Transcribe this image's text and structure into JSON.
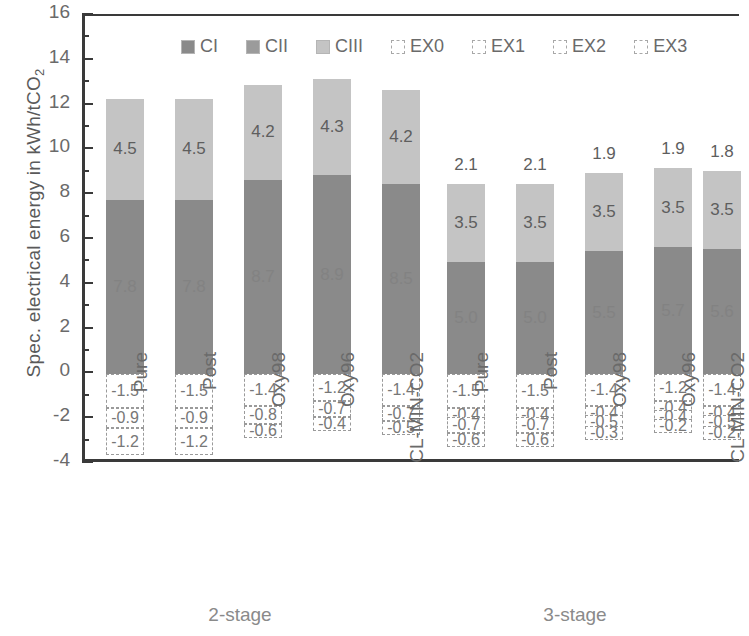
{
  "chart_data": {
    "type": "bar",
    "subtype": "stacked-bar",
    "title": "",
    "xlabel": "",
    "ylabel": "Spec. electrical energy in kWh/tCO2",
    "ylabel_display": "Spec. electrical energy in kWh/tCO",
    "ylabel_sub": "2",
    "ylim": [
      -4,
      16
    ],
    "ytick_step": 2,
    "yminor_step": 1,
    "grid": false,
    "legend_position": "top-inside",
    "yticks": [
      "16",
      "14",
      "12",
      "10",
      "8",
      "6",
      "4",
      "2",
      "0",
      "-2",
      "-4"
    ],
    "legend": [
      {
        "name": "CI",
        "color": "#8a8a8a",
        "style": "solid"
      },
      {
        "name": "CII",
        "color": "#9b9b9b",
        "style": "solid"
      },
      {
        "name": "CIII",
        "color": "#c4c4c4",
        "style": "solid"
      },
      {
        "name": "EX0",
        "color": "#ffffff",
        "style": "dashed"
      },
      {
        "name": "EX1",
        "color": "#ffffff",
        "style": "dashed"
      },
      {
        "name": "EX2",
        "color": "#ffffff",
        "style": "dashed"
      },
      {
        "name": "EX3",
        "color": "#ffffff",
        "style": "dashed"
      }
    ],
    "groups": [
      {
        "label": "2-stage",
        "categories": [
          "Pure",
          "Post",
          "Oxy98",
          "Oxy96",
          "CL-MIN-CO2"
        ]
      },
      {
        "label": "3-stage",
        "categories": [
          "Pure",
          "Post",
          "Oxy98",
          "Oxy96",
          "CL-MIN-CO2"
        ]
      }
    ],
    "categories": [
      "Pure",
      "Post",
      "Oxy98",
      "Oxy96",
      "CL-MIN-CO2",
      "Pure",
      "Post",
      "Oxy98",
      "Oxy96",
      "CL-MIN-CO2"
    ],
    "series": [
      {
        "name": "CI",
        "values": [
          7.8,
          7.8,
          4.7,
          4.9,
          4.3,
          5.0,
          5.0,
          5.0,
          5.0,
          5.2
        ]
      },
      {
        "name": "CII",
        "values": [
          0.0,
          0.0,
          4.0,
          4.0,
          4.2,
          0.0,
          0.0,
          0.0,
          0.0,
          0.0
        ]
      },
      {
        "name": "CIII",
        "values": [
          4.5,
          4.5,
          4.2,
          4.3,
          4.2,
          3.5,
          3.5,
          3.5,
          3.5,
          3.5
        ]
      },
      {
        "name": "EX0",
        "values": [
          2.1,
          2.1,
          1.9,
          1.9,
          1.8,
          2.1,
          2.1,
          1.9,
          1.9,
          1.8
        ]
      },
      {
        "name": "EX1",
        "values": [
          -1.5,
          -1.5,
          -1.4,
          -1.2,
          -1.4,
          -1.5,
          -1.5,
          -1.4,
          -1.2,
          -1.4
        ]
      },
      {
        "name": "EX2",
        "values": [
          -0.9,
          -0.9,
          -0.8,
          -0.7,
          -0.7,
          -0.4,
          -0.4,
          -0.4,
          -0.4,
          -0.4
        ]
      },
      {
        "name": "EX3",
        "values": [
          -1.2,
          -1.2,
          -0.6,
          -0.4,
          -0.5,
          -0.7,
          -0.7,
          -0.5,
          -0.4,
          -0.5
        ]
      },
      {
        "name": "EX4",
        "values": [
          null,
          null,
          null,
          null,
          null,
          -0.6,
          -0.6,
          -0.3,
          -0.2,
          -0.2
        ]
      }
    ],
    "bars": [
      {
        "category": "Pure",
        "group": "2-stage",
        "stack": [
          {
            "key": "ci",
            "value": 7.8,
            "label": "7.8",
            "from": 0.0,
            "to": 7.8,
            "show": "faint"
          },
          {
            "key": "ciii",
            "value": 4.5,
            "label": "4.5",
            "from": 7.8,
            "to": 12.3,
            "show": "inside"
          }
        ],
        "neg": [
          {
            "key": "ex1",
            "label": "-1.5",
            "from": 0.0,
            "to": -1.5
          },
          {
            "key": "ex2",
            "label": "-0.9",
            "from": -1.5,
            "to": -2.4
          },
          {
            "key": "ex3",
            "label": "-1.2",
            "from": -2.4,
            "to": -3.6
          }
        ]
      },
      {
        "category": "Post",
        "group": "2-stage",
        "stack": [
          {
            "key": "ci",
            "value": 7.8,
            "label": "7.8",
            "from": 0.0,
            "to": 7.8,
            "show": "faint"
          },
          {
            "key": "ciii",
            "value": 4.5,
            "label": "4.5",
            "from": 7.8,
            "to": 12.3,
            "show": "inside"
          }
        ],
        "neg": [
          {
            "key": "ex1",
            "label": "-1.5",
            "from": 0.0,
            "to": -1.5
          },
          {
            "key": "ex2",
            "label": "-0.9",
            "from": -1.5,
            "to": -2.4
          },
          {
            "key": "ex3",
            "label": "-1.2",
            "from": -2.4,
            "to": -3.6
          }
        ]
      },
      {
        "category": "Oxy98",
        "group": "2-stage",
        "stack": [
          {
            "key": "ci",
            "value": 8.7,
            "label": "8.7",
            "from": 0.0,
            "to": 8.7,
            "show": "faint"
          },
          {
            "key": "ciii",
            "value": 4.2,
            "label": "4.2",
            "from": 8.7,
            "to": 12.9,
            "show": "inside"
          }
        ],
        "neg": [
          {
            "key": "ex1",
            "label": "-1.4",
            "from": 0.0,
            "to": -1.4
          },
          {
            "key": "ex2",
            "label": "-0.8",
            "from": -1.4,
            "to": -2.2
          },
          {
            "key": "ex3",
            "label": "-0.6",
            "from": -2.2,
            "to": -2.8
          }
        ]
      },
      {
        "category": "Oxy96",
        "group": "2-stage",
        "stack": [
          {
            "key": "ci",
            "value": 8.9,
            "label": "8.9",
            "from": 0.0,
            "to": 8.9,
            "show": "faint"
          },
          {
            "key": "ciii",
            "value": 4.3,
            "label": "4.3",
            "from": 8.9,
            "to": 13.2,
            "show": "inside"
          }
        ],
        "neg": [
          {
            "key": "ex1",
            "label": "-1.2",
            "from": 0.0,
            "to": -1.2
          },
          {
            "key": "ex2",
            "label": "-0.7",
            "from": -1.2,
            "to": -1.9
          },
          {
            "key": "ex3",
            "label": "-0.4",
            "from": -1.9,
            "to": -2.3
          }
        ]
      },
      {
        "category": "CL-MIN-CO2",
        "group": "2-stage",
        "stack": [
          {
            "key": "ci",
            "value": 8.5,
            "label": "8.5",
            "from": 0.0,
            "to": 8.5,
            "show": "faint"
          },
          {
            "key": "ciii",
            "value": 4.2,
            "label": "4.2",
            "from": 8.5,
            "to": 12.7,
            "show": "inside"
          }
        ],
        "neg": [
          {
            "key": "ex1",
            "label": "-1.4",
            "from": 0.0,
            "to": -1.4
          },
          {
            "key": "ex2",
            "label": "-0.7",
            "from": -1.4,
            "to": -2.1
          },
          {
            "key": "ex3",
            "label": "-0.5",
            "from": -2.1,
            "to": -2.6
          }
        ]
      },
      {
        "category": "Pure",
        "group": "3-stage",
        "stack": [
          {
            "key": "ci",
            "value": 5.0,
            "label": "5.0",
            "from": 0.0,
            "to": 5.0,
            "show": "faint"
          },
          {
            "key": "ciii",
            "value": 3.5,
            "label": "3.5",
            "from": 5.0,
            "to": 8.5,
            "show": "inside"
          }
        ],
        "above": {
          "label": "2.1"
        },
        "neg": [
          {
            "key": "ex1",
            "label": "-1.5",
            "from": 0.0,
            "to": -1.5
          },
          {
            "key": "ex2",
            "label": "-0.4",
            "from": -1.5,
            "to": -1.9
          },
          {
            "key": "ex3",
            "label": "-0.7",
            "from": -1.9,
            "to": -2.6
          },
          {
            "key": "ex4",
            "label": "-0.6",
            "from": -2.6,
            "to": -3.2
          }
        ]
      },
      {
        "category": "Post",
        "group": "3-stage",
        "stack": [
          {
            "key": "ci",
            "value": 5.0,
            "label": "5.0",
            "from": 0.0,
            "to": 5.0,
            "show": "faint"
          },
          {
            "key": "ciii",
            "value": 3.5,
            "label": "3.5",
            "from": 5.0,
            "to": 8.5,
            "show": "inside"
          }
        ],
        "above": {
          "label": "2.1"
        },
        "neg": [
          {
            "key": "ex1",
            "label": "-1.5",
            "from": 0.0,
            "to": -1.5
          },
          {
            "key": "ex2",
            "label": "-0.4",
            "from": -1.5,
            "to": -1.9
          },
          {
            "key": "ex3",
            "label": "-0.7",
            "from": -1.9,
            "to": -2.6
          },
          {
            "key": "ex4",
            "label": "-0.6",
            "from": -2.6,
            "to": -3.2
          }
        ]
      },
      {
        "category": "Oxy98",
        "group": "3-stage",
        "stack": [
          {
            "key": "ci",
            "value": 5.5,
            "label": "5.5",
            "from": 0.0,
            "to": 5.5,
            "show": "faint"
          },
          {
            "key": "ciii",
            "value": 3.5,
            "label": "3.5",
            "from": 5.5,
            "to": 9.0,
            "show": "inside"
          }
        ],
        "above": {
          "label": "1.9"
        },
        "neg": [
          {
            "key": "ex1",
            "label": "-1.4",
            "from": 0.0,
            "to": -1.4
          },
          {
            "key": "ex2",
            "label": "-0.4",
            "from": -1.4,
            "to": -1.8
          },
          {
            "key": "ex3",
            "label": "-0.5",
            "from": -1.8,
            "to": -2.3
          },
          {
            "key": "ex4",
            "label": "-0.3",
            "from": -2.3,
            "to": -2.6
          }
        ]
      },
      {
        "category": "Oxy96",
        "group": "3-stage",
        "stack": [
          {
            "key": "ci",
            "value": 5.7,
            "label": "5.7",
            "from": 0.0,
            "to": 5.7,
            "show": "faint"
          },
          {
            "key": "ciii",
            "value": 3.5,
            "label": "3.5",
            "from": 5.7,
            "to": 9.2,
            "show": "inside"
          }
        ],
        "above": {
          "label": "1.9"
        },
        "neg": [
          {
            "key": "ex1",
            "label": "-1.2",
            "from": 0.0,
            "to": -1.2
          },
          {
            "key": "ex2",
            "label": "-0.4",
            "from": -1.2,
            "to": -1.6
          },
          {
            "key": "ex3",
            "label": "-0.4",
            "from": -1.6,
            "to": -2.0
          },
          {
            "key": "ex4",
            "label": "-0.2",
            "from": -2.0,
            "to": -2.2
          }
        ]
      },
      {
        "category": "CL-MIN-CO2",
        "group": "3-stage",
        "stack": [
          {
            "key": "ci",
            "value": 5.6,
            "label": "5.6",
            "from": 0.0,
            "to": 5.6,
            "show": "faint"
          },
          {
            "key": "ciii",
            "value": 3.5,
            "label": "3.5",
            "from": 5.6,
            "to": 9.1,
            "show": "inside"
          }
        ],
        "above": {
          "label": "1.8"
        },
        "neg": [
          {
            "key": "ex1",
            "label": "-1.4",
            "from": 0.0,
            "to": -1.4
          },
          {
            "key": "ex2",
            "label": "-0.4",
            "from": -1.4,
            "to": -1.8
          },
          {
            "key": "ex3",
            "label": "-0.5",
            "from": -1.8,
            "to": -2.3
          },
          {
            "key": "ex4",
            "label": "-0.2",
            "from": -2.3,
            "to": -2.5
          }
        ]
      }
    ]
  }
}
